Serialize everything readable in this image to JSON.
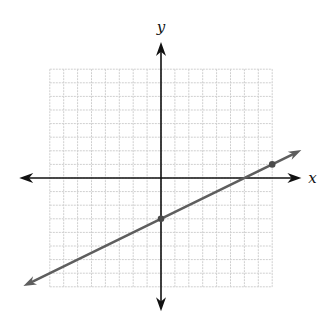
{
  "chart_data": {
    "type": "line",
    "title": "",
    "xlabel": "x",
    "ylabel": "y",
    "grid": true,
    "grid_range": {
      "x": [
        -8,
        8
      ],
      "y": [
        -8,
        8
      ]
    },
    "grid_step": 1,
    "axis_extent": {
      "x": [
        -10.2,
        10.1
      ],
      "y": [
        -9.8,
        10.0
      ]
    },
    "tick_labels": false,
    "series": [
      {
        "name": "line",
        "equation": "y = 0.5x - 3",
        "slope": 0.5,
        "intercept": -3,
        "x_range": [
          -9.9,
          10.1
        ],
        "arrows": "both",
        "points": [
          {
            "x": 0,
            "y": -3
          },
          {
            "x": 8,
            "y": 1
          }
        ]
      }
    ],
    "colors": {
      "axis": "#111111",
      "grid": "#cfcfcf",
      "line": "#5e5e5e",
      "point": "#4a4a4a"
    }
  }
}
